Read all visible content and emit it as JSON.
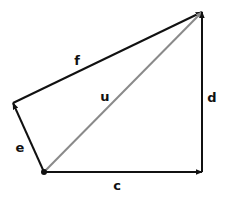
{
  "diagram": {
    "type": "vector-diagram",
    "colors": {
      "black_vector": "#111111",
      "resultant_vector": "#8a8a8a",
      "background": "#ffffff"
    },
    "points": {
      "origin": [
        44,
        172
      ],
      "left": [
        13,
        103
      ],
      "top": [
        202,
        12
      ],
      "bottom_right": [
        202,
        172
      ]
    },
    "vectors": [
      {
        "id": "e",
        "label": "e",
        "from": "origin",
        "to": "left",
        "color": "#111111",
        "label_pos": [
          20,
          147
        ]
      },
      {
        "id": "f",
        "label": "f",
        "from": "left",
        "to": "top",
        "color": "#111111",
        "label_pos": [
          77,
          60
        ]
      },
      {
        "id": "u",
        "label": "u",
        "from": "origin",
        "to": "top",
        "color": "#8a8a8a",
        "label_pos": [
          105,
          96
        ]
      },
      {
        "id": "c",
        "label": "c",
        "from": "origin",
        "to": "bottom_right",
        "color": "#111111",
        "label_pos": [
          117,
          185
        ]
      },
      {
        "id": "d",
        "label": "d",
        "from": "bottom_right",
        "to": "top",
        "color": "#111111",
        "label_pos": [
          212,
          97
        ]
      }
    ]
  }
}
